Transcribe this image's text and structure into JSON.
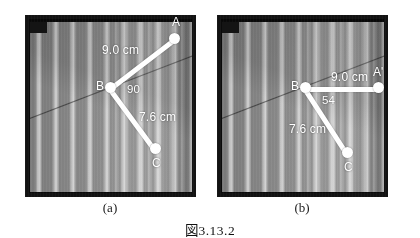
{
  "figure": {
    "caption": "図3.13.2",
    "panels": [
      {
        "id": "a",
        "caption": "(a)",
        "points": [
          {
            "name": "A",
            "label": "A"
          },
          {
            "name": "B",
            "label": "B"
          },
          {
            "name": "C",
            "label": "C"
          }
        ],
        "measurements": [
          {
            "name": "BA-length",
            "label": "9.0 cm"
          },
          {
            "name": "BC-length",
            "label": "7.6 cm"
          },
          {
            "name": "ABC-angle",
            "label": "90"
          }
        ]
      },
      {
        "id": "b",
        "caption": "(b)",
        "points": [
          {
            "name": "A-prime",
            "label": "A'"
          },
          {
            "name": "B",
            "label": "B"
          },
          {
            "name": "C",
            "label": "C"
          }
        ],
        "measurements": [
          {
            "name": "BA-length",
            "label": "9.0 cm"
          },
          {
            "name": "BC-length",
            "label": "7.6 cm"
          },
          {
            "name": "ABC-angle",
            "label": "54"
          }
        ]
      }
    ]
  },
  "colors": {
    "overlay": "#ffffff",
    "frame": "#121212",
    "page": "#ffffff",
    "text": "#111111"
  }
}
